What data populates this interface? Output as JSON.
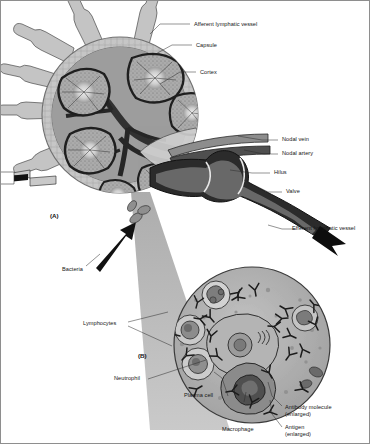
{
  "figure": {
    "panels": [
      {
        "id": "A",
        "label": "(A)",
        "caption": "Lymph node cross-section"
      },
      {
        "id": "B",
        "label": "(B)",
        "caption": "Magnified lymphoid tissue"
      }
    ],
    "background_color": "#ffffff",
    "ink_color": "#1a1a1a"
  },
  "labels": {
    "afferent_lymphatic_vessel": "Afferent lymphatic vessel",
    "capsule": "Capsule",
    "cortex": "Cortex",
    "nodal_vein": "Nodal vein",
    "nodal_artery": "Nodal artery",
    "hilus": "Hilus",
    "valve": "Valve",
    "efferent_lymphatic_vessel": "Efferent lymphatic vessel",
    "bacteria": "Bacteria",
    "lymphocytes": "Lymphocytes",
    "neutrophil": "Neutrophil",
    "plasma_cell": "Plasma cell",
    "macrophage": "Macrophage",
    "antibody_molecule": "Antibody molecule",
    "antibody_molecule_note": "(enlarged)",
    "antigen": "Antigen",
    "antigen_note": "(enlarged)",
    "panel_a": "(A)",
    "panel_b": "(B)"
  },
  "colors": {
    "capsule_fill": "#c9c9c9",
    "cortex_fill": "#a9a9a9",
    "germinal_center": "#dcdcdc",
    "medulla_dark": "#3d3d3d",
    "vessel_light": "#c4c4c4",
    "vessel_dark": "#2e2e2e",
    "beam_gray": "#b5b5b5",
    "panel_b_fill": "#b6b6b6",
    "cell_light": "#cdcdcd",
    "cell_mid": "#9a9a9a",
    "cell_dark": "#6b6b6b",
    "outline": "#2a2a2a"
  },
  "panel_b_cells": [
    {
      "name": "neutrophil",
      "cx": 215,
      "cy": 302,
      "r": 13
    },
    {
      "name": "lymphocyte-upper",
      "cx": 192,
      "cy": 330,
      "r": 14
    },
    {
      "name": "lymphocyte-lower",
      "cx": 200,
      "cy": 362,
      "r": 15
    },
    {
      "name": "macrophage",
      "cx": 246,
      "cy": 378,
      "r": 19
    },
    {
      "name": "plasma-cell",
      "cx": 247,
      "cy": 337,
      "r": 24
    },
    {
      "name": "antigen-cell",
      "cx": 299,
      "cy": 318,
      "r": 12
    }
  ]
}
